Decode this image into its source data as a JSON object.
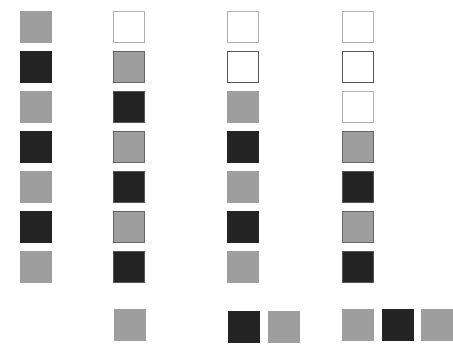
{
  "legend": {
    "light": "light-gray-square",
    "dark": "dark-square",
    "empty": "empty-square-light-border",
    "empty-dark": "empty-square-dark-border"
  },
  "colors": {
    "light": "#9e9e9e",
    "dark": "#242424",
    "empty_border": "#b0b0b0",
    "empty_dark_border": "#555555"
  },
  "columns": [
    {
      "name": "column-1",
      "stack": [
        {
          "kind": "light",
          "bordered": false
        },
        {
          "kind": "dark",
          "bordered": false
        },
        {
          "kind": "light",
          "bordered": false
        },
        {
          "kind": "dark",
          "bordered": false
        },
        {
          "kind": "light",
          "bordered": false
        },
        {
          "kind": "dark",
          "bordered": false
        },
        {
          "kind": "light",
          "bordered": false
        }
      ],
      "bottom": []
    },
    {
      "name": "column-2",
      "stack": [
        {
          "kind": "empty",
          "bordered": true
        },
        {
          "kind": "light",
          "bordered": true
        },
        {
          "kind": "dark",
          "bordered": true
        },
        {
          "kind": "light",
          "bordered": true
        },
        {
          "kind": "dark",
          "bordered": true
        },
        {
          "kind": "light",
          "bordered": true
        },
        {
          "kind": "dark",
          "bordered": true
        }
      ],
      "bottom": [
        {
          "kind": "light",
          "bordered": false
        }
      ]
    },
    {
      "name": "column-3",
      "stack": [
        {
          "kind": "empty",
          "bordered": true
        },
        {
          "kind": "empty-dark",
          "bordered": true
        },
        {
          "kind": "light",
          "bordered": false
        },
        {
          "kind": "dark",
          "bordered": false
        },
        {
          "kind": "light",
          "bordered": false
        },
        {
          "kind": "dark",
          "bordered": false
        },
        {
          "kind": "light",
          "bordered": false
        }
      ],
      "bottom": [
        {
          "kind": "dark",
          "bordered": false
        },
        {
          "kind": "light",
          "bordered": false
        }
      ]
    },
    {
      "name": "column-4",
      "stack": [
        {
          "kind": "empty",
          "bordered": true
        },
        {
          "kind": "empty-dark",
          "bordered": true
        },
        {
          "kind": "empty",
          "bordered": true
        },
        {
          "kind": "light",
          "bordered": true
        },
        {
          "kind": "dark",
          "bordered": true
        },
        {
          "kind": "light",
          "bordered": true
        },
        {
          "kind": "dark",
          "bordered": true
        }
      ],
      "bottom": [
        {
          "kind": "light",
          "bordered": false
        },
        {
          "kind": "dark",
          "bordered": false
        },
        {
          "kind": "light",
          "bordered": false
        }
      ]
    }
  ]
}
